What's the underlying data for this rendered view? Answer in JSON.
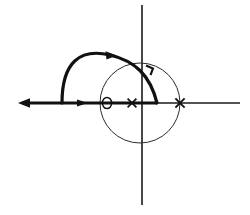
{
  "figure": {
    "background_color": "#ffffff",
    "line_color": "#111111",
    "axis_color": "#1a1a1a",
    "circle_color": "#2b2b2b",
    "width": 250,
    "height": 215
  },
  "chart_data": {
    "type": "scatter",
    "title": "",
    "xlabel": "",
    "ylabel": "",
    "grid": false,
    "legend": "none",
    "axes": {
      "real_axis": {
        "y_px": 103,
        "x_start_px": 20,
        "x_end_px": 240,
        "arrow_at": "left",
        "label": ""
      },
      "imaginary_axis": {
        "x_px": 142,
        "y_start_px": 5,
        "y_end_px": 205,
        "arrow_at": "none",
        "label": ""
      },
      "origin_px": [
        142,
        103
      ]
    },
    "poles": [
      {
        "marker": "x",
        "label": "pole",
        "x_px": 132,
        "y_px": 103
      },
      {
        "marker": "x",
        "label": "pole",
        "x_px": 180,
        "y_px": 103
      }
    ],
    "zeros": [
      {
        "marker": "o",
        "label": "zero",
        "x_px": 107,
        "y_px": 103
      }
    ],
    "unit_circle": {
      "center_px": [
        140,
        103
      ],
      "radius_px": 40,
      "style": "thin"
    },
    "branches": [
      {
        "name": "real-axis-segment",
        "style": "thick",
        "from_px": [
          20,
          103
        ],
        "to_px": [
          62,
          103
        ],
        "direction_arrows": [
          {
            "x_px": 27,
            "y_px": 103,
            "points": "left"
          },
          {
            "x_px": 82,
            "y_px": 103,
            "points": "right"
          }
        ]
      },
      {
        "name": "large-departure-arc",
        "style": "thick",
        "start_px": [
          62,
          103
        ],
        "apex_px": [
          110,
          55
        ],
        "end_px": [
          157,
          103
        ],
        "direction_arrows": [
          {
            "x_px": 108,
            "y_px": 55,
            "points": "right"
          }
        ]
      }
    ],
    "annotations": [
      {
        "name": "right-angle-tick",
        "x_px": 150,
        "y_px": 70,
        "text": ""
      }
    ]
  },
  "labels": {
    "zero_glyph": "O",
    "pole_glyph": "×"
  }
}
